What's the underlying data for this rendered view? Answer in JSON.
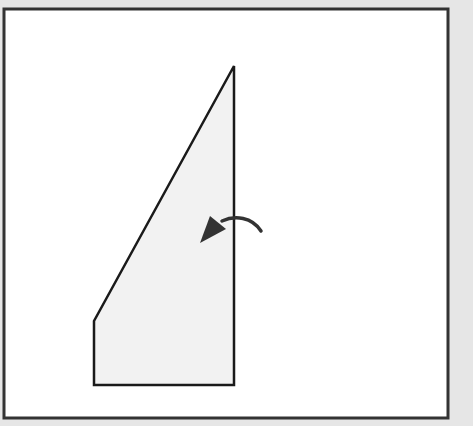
{
  "diagram": {
    "background_color": "#e6e6e6",
    "frame": {
      "x": 4,
      "y": 9,
      "width": 444,
      "height": 409,
      "fill": "#ffffff",
      "stroke": "#333333"
    },
    "shape": {
      "points": [
        [
          234,
          66
        ],
        [
          234,
          385
        ],
        [
          94,
          385
        ],
        [
          94,
          321
        ]
      ],
      "fill": "#f2f2f2",
      "stroke": "#1a1a1a"
    },
    "rotation_arrow": {
      "direction": "counter-clockwise",
      "color": "#333333"
    }
  }
}
